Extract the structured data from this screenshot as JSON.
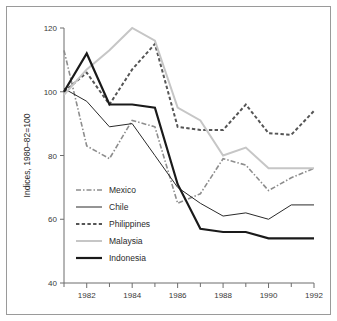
{
  "chart_data": {
    "type": "line",
    "title": "",
    "xlabel": "",
    "ylabel": "Indices, 1980–82=100",
    "xlim": [
      1981,
      1992
    ],
    "ylim": [
      40,
      120
    ],
    "yticks": [
      40,
      60,
      80,
      100,
      120
    ],
    "ytick_labels": [
      "40",
      "60",
      "80",
      "100",
      "120"
    ],
    "x": [
      1981,
      1982,
      1983,
      1984,
      1985,
      1986,
      1987,
      1988,
      1989,
      1990,
      1991,
      1992
    ],
    "xticks_major": [
      1982,
      1984,
      1986,
      1988,
      1990,
      1992
    ],
    "xtick_labels": [
      "1982",
      "1984",
      "1986",
      "1988",
      "1990",
      "1992"
    ],
    "xticks_minor": [
      1981,
      1983,
      1985,
      1987,
      1989,
      1991
    ],
    "grid": false,
    "legend_position": "lower-left-inside",
    "series": [
      {
        "name": "Mexico",
        "style": "dashdot",
        "color": "#8d8d8d",
        "width": 1.6,
        "values": [
          113,
          83,
          79,
          91,
          89,
          65,
          68,
          79,
          77,
          69,
          73,
          76
        ]
      },
      {
        "name": "Chile",
        "style": "solid",
        "color": "#2a2a2a",
        "width": 1.0,
        "values": [
          101,
          97,
          89,
          90,
          80,
          70,
          65,
          61,
          62,
          60,
          64.5,
          64.5
        ]
      },
      {
        "name": "Philippines",
        "style": "dashed",
        "color": "#555555",
        "width": 2.0,
        "values": [
          100,
          106,
          96,
          107,
          115,
          89,
          88,
          88,
          96,
          87,
          86.5,
          94
        ]
      },
      {
        "name": "Malaysia",
        "style": "solid",
        "color": "#c6c6c6",
        "width": 2.0,
        "values": [
          99,
          107,
          113,
          120,
          116,
          95,
          91,
          80,
          82.5,
          76,
          76,
          76
        ]
      },
      {
        "name": "Indonesia",
        "style": "solid",
        "color": "#1a1a1a",
        "width": 2.2,
        "values": [
          100,
          112,
          96,
          96,
          95,
          71,
          57,
          56,
          56,
          54,
          54,
          54
        ]
      }
    ]
  },
  "legend": {
    "items": [
      {
        "label": "Mexico"
      },
      {
        "label": "Chile"
      },
      {
        "label": "Philippines"
      },
      {
        "label": "Malaysia"
      },
      {
        "label": "Indonesia"
      }
    ]
  }
}
